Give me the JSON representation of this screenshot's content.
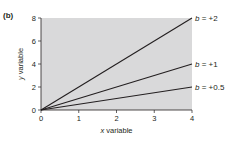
{
  "panel_label": "(b)",
  "chart_data": {
    "type": "line",
    "title": "",
    "xlabel": "x variable",
    "ylabel": "y variable",
    "xlim": [
      0,
      4
    ],
    "ylim": [
      0,
      8
    ],
    "x_ticks": [
      0,
      1,
      2,
      3,
      4
    ],
    "y_ticks": [
      0,
      2,
      4,
      6,
      8
    ],
    "grid": false,
    "plot_background": "#d9d9da",
    "line_color": "#231f20",
    "legend_position": "inline-right",
    "series": [
      {
        "name": "b = +2",
        "slope": 2,
        "x": [
          0,
          4
        ],
        "y": [
          0,
          8
        ]
      },
      {
        "name": "b = +1",
        "slope": 1,
        "x": [
          0,
          4
        ],
        "y": [
          0,
          4
        ]
      },
      {
        "name": "b = +0.5",
        "slope": 0.5,
        "x": [
          0,
          4
        ],
        "y": [
          0,
          2
        ]
      }
    ]
  },
  "labels": {
    "x_axis": {
      "var": "x",
      "rest": " variable"
    },
    "y_axis": {
      "var": "y",
      "rest": " variable"
    },
    "series": [
      {
        "var": "b",
        "rest": " = +2"
      },
      {
        "var": "b",
        "rest": " = +1"
      },
      {
        "var": "b",
        "rest": " = +0.5"
      }
    ]
  }
}
